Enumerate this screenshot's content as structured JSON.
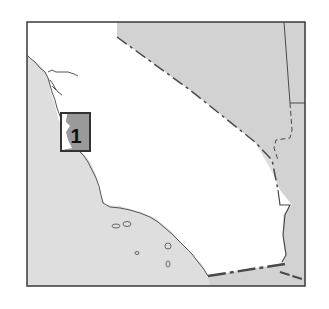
{
  "map": {
    "region": "California",
    "colors": {
      "ocean": "#dedede",
      "neighbor_land": "#d2d2d2",
      "state_fill": "#ffffff",
      "frame": "#3a3a3a",
      "coastline": "#555555",
      "border": "#4a4a4a",
      "marker_fill": "#9a9a9a",
      "marker_border": "#333333"
    },
    "markers": [
      {
        "id": 1,
        "label": "1"
      }
    ]
  }
}
